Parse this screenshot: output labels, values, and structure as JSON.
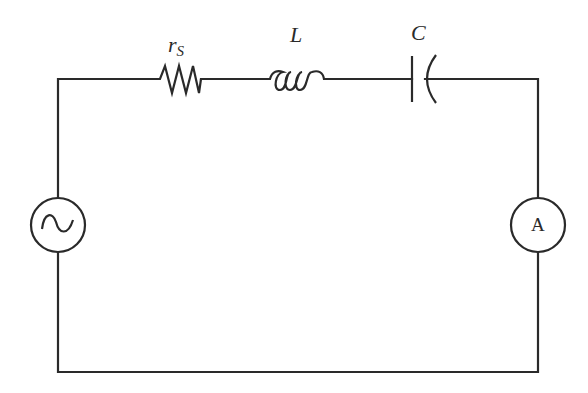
{
  "diagram": {
    "type": "series RLC circuit",
    "stroke_color": "#2a2a2a",
    "background": "#ffffff",
    "components": {
      "resistor": {
        "symbol": "r",
        "subscript": "S"
      },
      "inductor": {
        "symbol": "L"
      },
      "capacitor": {
        "symbol": "C"
      },
      "source": {
        "kind": "ac-voltage-source",
        "glyph": "~"
      },
      "ammeter": {
        "kind": "ammeter",
        "text": "A"
      }
    }
  }
}
